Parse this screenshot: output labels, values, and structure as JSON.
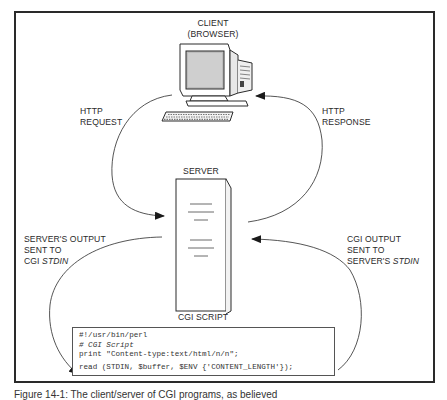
{
  "diagram": {
    "client": {
      "label_line1": "CLIENT",
      "label_line2": "(BROWSER)",
      "icon": "computer-monitor-keyboard"
    },
    "server": {
      "label": "SERVER",
      "icon": "server-tower"
    },
    "cgi_script": {
      "label": "CGI SCRIPT",
      "code_lines": [
        "#!/usr/bin/perl",
        "# CGI Script",
        "print \"Content-type:text/html/n/n\";",
        "read (STDIN, $buffer, $ENV {'CONTENT_LENGTH'});"
      ]
    },
    "arrows": {
      "http_request": {
        "line1": "HTTP",
        "line2": "REQUEST"
      },
      "http_response": {
        "line1": "HTTP",
        "line2": "RESPONSE"
      },
      "server_output": {
        "line1": "SERVER'S OUTPUT",
        "line2": "SENT TO",
        "line3_prefix": "CGI ",
        "line3_italic": "STDIN"
      },
      "cgi_output": {
        "line1": "CGI OUTPUT",
        "line2": "SENT TO",
        "line3_prefix": "SERVER'S ",
        "line3_italic": "STDIN"
      }
    },
    "colors": {
      "line": "#2a2a2a",
      "frame": "#2a2a2a",
      "background": "#ffffff"
    }
  },
  "caption": "Figure 14-1: The client/server of CGI programs, as believed"
}
